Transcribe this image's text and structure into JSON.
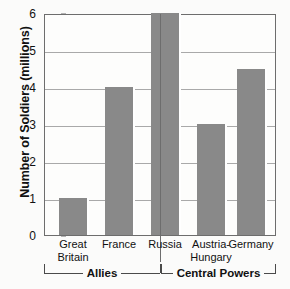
{
  "chart_data": {
    "type": "bar",
    "title": "",
    "xlabel": "",
    "ylabel": "Number of Soldiers (millions)",
    "categories": [
      "Great Britain",
      "France",
      "Russia",
      "Austria-Hungary",
      "Germany"
    ],
    "values": [
      1.0,
      4.0,
      6.0,
      3.0,
      4.5
    ],
    "ylim": [
      0,
      6
    ],
    "yticks": [
      0,
      1,
      2,
      3,
      4,
      5,
      6
    ],
    "ytick_labels": [
      "0",
      "1",
      "2",
      "3",
      "4",
      "5",
      "6"
    ],
    "grid": true,
    "legend": "none",
    "groups": [
      {
        "label": "Allies",
        "categories": [
          "Great Britain",
          "France",
          "Russia"
        ]
      },
      {
        "label": "Central Powers",
        "categories": [
          "Austria-Hungary",
          "Germany"
        ]
      }
    ],
    "category_lines": [
      [
        "Great",
        "Britain"
      ],
      [
        "France"
      ],
      [
        "Russia"
      ],
      [
        "Austria-",
        "Hungary"
      ],
      [
        "Germany"
      ]
    ],
    "colors": {
      "bar_fill": "#898989",
      "bar_highlight": "#ffffff",
      "axis": "#6d6d6d",
      "grid": "#a9a9a9",
      "text": "#111111",
      "background": "#fbfbfa"
    }
  }
}
